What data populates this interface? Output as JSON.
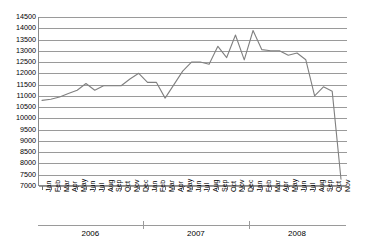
{
  "chart_data": {
    "type": "line",
    "title": "",
    "xlabel": "",
    "ylabel": "",
    "ylim": [
      7000,
      14500
    ],
    "ytick_step": 500,
    "yticks": [
      14500,
      14000,
      13500,
      13000,
      12500,
      12000,
      11500,
      11000,
      10500,
      10000,
      9500,
      9000,
      8500,
      8000,
      7500,
      7000
    ],
    "grid": true,
    "legend": "none",
    "line_color": "#808080",
    "categories": [
      "Jan",
      "Feb",
      "Mar",
      "Apr",
      "May",
      "Jun",
      "Jul",
      "Aug",
      "Sep",
      "Oct",
      "Nov",
      "Dec",
      "Jan",
      "Feb",
      "Mar",
      "Apr",
      "May",
      "Jun",
      "Jul",
      "Aug",
      "Sep",
      "Oct",
      "Nov",
      "Dec",
      "Jan",
      "Feb",
      "Mar",
      "Apr",
      "May",
      "Jun",
      "Jul",
      "Aug",
      "Sep",
      "Oct",
      "Nov"
    ],
    "year_groups": [
      {
        "label": "2006",
        "start_index": 0,
        "end_index": 11
      },
      {
        "label": "2007",
        "start_index": 12,
        "end_index": 23
      },
      {
        "label": "2008",
        "start_index": 24,
        "end_index": 34
      }
    ],
    "series": [
      {
        "name": "Index",
        "values": [
          10800,
          10850,
          10950,
          11100,
          11250,
          11550,
          11250,
          11450,
          11450,
          11450,
          11750,
          12000,
          11600,
          11600,
          10900,
          11500,
          12100,
          12500,
          12500,
          12400,
          13200,
          12700,
          13700,
          12600,
          13900,
          13050,
          13000,
          13000,
          12800,
          12900,
          12600,
          11000,
          11400,
          11200,
          7300
        ]
      }
    ]
  }
}
